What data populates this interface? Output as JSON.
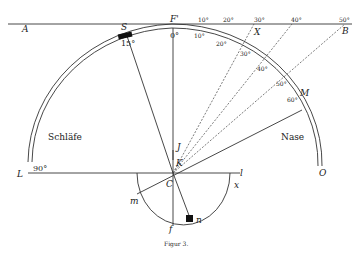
{
  "figure": {
    "caption": "Figur 3.",
    "regions": {
      "left": "Schläfe",
      "right": "Nase"
    },
    "points": {
      "A": "A",
      "B": "B",
      "F_prime": "F'",
      "S": "S",
      "X": "X",
      "M": "M",
      "L": "L",
      "O": "O",
      "K": "K",
      "J": "J",
      "C": "C",
      "l": "l",
      "x": "x",
      "m": "m",
      "n": "n",
      "f": "f"
    },
    "top_scale_ticks": [
      "10°",
      "20°",
      "30°",
      "40°",
      "50°"
    ],
    "arc_ticks": [
      "0°",
      "10°",
      "20°",
      "30°",
      "40°",
      "50°",
      "60°"
    ],
    "arc_left_labels": {
      "s_angle": "15°",
      "l_angle": "90°"
    },
    "colors": {
      "ink": "#333333",
      "background": "#ffffff"
    }
  }
}
